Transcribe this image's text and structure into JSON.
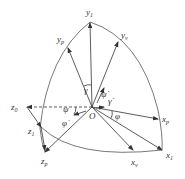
{
  "diagram": {
    "origin": {
      "label": "O",
      "x": 92,
      "y": 107
    },
    "axes": [
      {
        "name": "y1",
        "base": "y",
        "sub": "1",
        "tip": [
          90,
          22
        ],
        "label_pos": [
          86,
          15
        ]
      },
      {
        "name": "yp",
        "base": "y",
        "sub": "p",
        "tip": [
          68,
          48
        ],
        "label_pos": [
          57,
          42
        ]
      },
      {
        "name": "yv",
        "base": "y",
        "sub": "v",
        "tip": [
          118,
          42
        ],
        "label_pos": [
          121,
          38
        ]
      },
      {
        "name": "z0",
        "base": "z",
        "sub": "0",
        "tip": [
          27,
          107
        ],
        "label_pos": [
          11,
          110
        ]
      },
      {
        "name": "z1",
        "base": "z",
        "sub": "1",
        "tip": [
          41,
          127
        ],
        "label_pos": [
          28,
          134
        ]
      },
      {
        "name": "zp",
        "base": "z",
        "sub": "p",
        "tip": [
          45,
          152
        ],
        "label_pos": [
          41,
          164
        ]
      },
      {
        "name": "xp",
        "base": "x",
        "sub": "p",
        "tip": [
          158,
          119
        ],
        "label_pos": [
          162,
          122
        ]
      },
      {
        "name": "x1",
        "base": "x",
        "sub": "1",
        "tip": [
          162,
          150
        ],
        "label_pos": [
          166,
          158
        ]
      },
      {
        "name": "xv",
        "base": "x",
        "sub": "v",
        "tip": [
          133,
          150
        ],
        "label_pos": [
          131,
          165
        ]
      }
    ],
    "angles": [
      {
        "name": "gamma",
        "symbol": "γ",
        "pos": [
          84,
          86
        ]
      },
      {
        "name": "psi-dot",
        "symbol": "ψ̇",
        "pos": [
          101,
          95
        ]
      },
      {
        "name": "gamma-dot",
        "symbol": "γ̇",
        "pos": [
          108,
          109
        ]
      },
      {
        "name": "phi",
        "symbol": "φ",
        "pos": [
          113,
          122
        ]
      },
      {
        "name": "psi",
        "symbol": "ψ",
        "pos": [
          58,
          115
        ]
      },
      {
        "name": "phi-dot",
        "symbol": "φ̇",
        "pos": [
          63,
          130
        ]
      }
    ]
  }
}
